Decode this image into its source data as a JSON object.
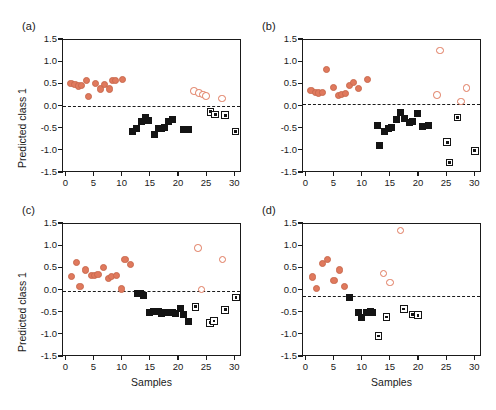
{
  "figure": {
    "panel_labels": [
      "(a)",
      "(b)",
      "(c)",
      "(d)"
    ],
    "accent_color": "#e0795d",
    "marker_dark_color": "#141414"
  },
  "axes": {
    "ylabel": "Predicted class 1",
    "xlabel": "Samples",
    "yticks": [
      "1.5",
      "1.0",
      "0.5",
      "0.0",
      "-0.5",
      "-1.0",
      "-1.5"
    ],
    "ytick_values": [
      1.5,
      1.0,
      0.5,
      0.0,
      -0.5,
      -1.0,
      -1.5
    ],
    "xticks": [
      "0",
      "5",
      "10",
      "15",
      "20",
      "25",
      "30"
    ],
    "xtick_values": [
      0,
      5,
      10,
      15,
      20,
      25,
      30
    ],
    "ylim": [
      -1.5,
      1.5
    ],
    "xlim": [
      -0.6,
      31.2
    ]
  },
  "chart_data": [
    {
      "type": "scatter",
      "panel": "(a)",
      "title": "",
      "xlabel": "Samples",
      "ylabel": "Predicted class 1",
      "xlim": [
        -0.6,
        31.2
      ],
      "ylim": [
        -1.5,
        1.5
      ],
      "grid": false,
      "legend": "none",
      "threshold_line": 0.0,
      "series": [
        {
          "name": "training class 1 (filled circle)",
          "marker": "filled-circle",
          "color": "#e0795d",
          "points": [
            [
              1.0,
              0.49
            ],
            [
              1.7,
              0.47
            ],
            [
              2.3,
              0.44
            ],
            [
              2.9,
              0.45
            ],
            [
              3.7,
              0.56
            ],
            [
              4.1,
              0.2
            ],
            [
              5.3,
              0.5
            ],
            [
              6.2,
              0.37
            ],
            [
              6.9,
              0.47
            ],
            [
              7.8,
              0.37
            ],
            [
              8.4,
              0.57
            ],
            [
              8.9,
              0.56
            ],
            [
              10.2,
              0.59
            ]
          ]
        },
        {
          "name": "training class 2 (filled square)",
          "marker": "filled-square",
          "color": "#141414",
          "points": [
            [
              11.9,
              -0.58
            ],
            [
              12.6,
              -0.52
            ],
            [
              13.6,
              -0.37
            ],
            [
              14.2,
              -0.28
            ],
            [
              14.7,
              -0.33
            ],
            [
              15.9,
              -0.65
            ],
            [
              16.6,
              -0.53
            ],
            [
              17.1,
              -0.52
            ],
            [
              17.6,
              -0.5
            ],
            [
              18.4,
              -0.37
            ],
            [
              19.1,
              -0.31
            ],
            [
              21.0,
              -0.55
            ],
            [
              21.8,
              -0.54
            ]
          ]
        },
        {
          "name": "test class 1 (open circle)",
          "marker": "open-circle",
          "color": "#e0795d",
          "points": [
            [
              22.9,
              0.33
            ],
            [
              23.7,
              0.28
            ],
            [
              24.4,
              0.25
            ],
            [
              25.0,
              0.22
            ],
            [
              27.8,
              0.16
            ]
          ]
        },
        {
          "name": "test class 2 (open square)",
          "marker": "open-square",
          "color": "#141414",
          "points": [
            [
              25.8,
              -0.14
            ],
            [
              26.6,
              -0.2
            ],
            [
              28.4,
              -0.22
            ],
            [
              30.2,
              -0.59
            ]
          ]
        }
      ]
    },
    {
      "type": "scatter",
      "panel": "(b)",
      "title": "",
      "xlabel": "Samples",
      "ylabel": "Predicted class 1",
      "xlim": [
        -0.6,
        31.2
      ],
      "ylim": [
        -1.5,
        1.5
      ],
      "grid": false,
      "legend": "none",
      "threshold_line": 0.03,
      "series": [
        {
          "name": "training class 1 (filled circle)",
          "marker": "filled-circle",
          "color": "#e0795d",
          "points": [
            [
              1.0,
              0.33
            ],
            [
              1.8,
              0.29
            ],
            [
              2.4,
              0.28
            ],
            [
              3.1,
              0.3
            ],
            [
              3.8,
              0.81
            ],
            [
              5.0,
              0.4
            ],
            [
              5.9,
              0.22
            ],
            [
              6.4,
              0.24
            ],
            [
              7.1,
              0.27
            ],
            [
              7.9,
              0.45
            ],
            [
              8.6,
              0.51
            ],
            [
              9.5,
              0.39
            ],
            [
              11.0,
              0.58
            ]
          ]
        },
        {
          "name": "training class 2 (filled square)",
          "marker": "filled-square",
          "color": "#141414",
          "points": [
            [
              12.9,
              -0.46
            ],
            [
              13.2,
              -0.91
            ],
            [
              14.1,
              -0.59
            ],
            [
              14.8,
              -0.53
            ],
            [
              15.3,
              -0.5
            ],
            [
              16.1,
              -0.31
            ],
            [
              16.9,
              -0.16
            ],
            [
              17.6,
              -0.3
            ],
            [
              18.5,
              -0.38
            ],
            [
              19.0,
              -0.35
            ],
            [
              20.0,
              -0.19
            ],
            [
              20.8,
              -0.48
            ],
            [
              21.8,
              -0.46
            ]
          ]
        },
        {
          "name": "test class 1 (open circle)",
          "marker": "open-circle",
          "color": "#e0795d",
          "points": [
            [
              23.9,
              1.24
            ],
            [
              23.4,
              0.24
            ],
            [
              27.6,
              0.09
            ],
            [
              28.6,
              0.39
            ]
          ]
        },
        {
          "name": "test class 2 (open square)",
          "marker": "open-square",
          "color": "#141414",
          "points": [
            [
              25.2,
              -0.83
            ],
            [
              25.6,
              -1.29
            ],
            [
              27.0,
              -0.27
            ],
            [
              30.1,
              -1.02
            ]
          ]
        }
      ]
    },
    {
      "type": "scatter",
      "panel": "(c)",
      "title": "",
      "xlabel": "Samples",
      "ylabel": "Predicted class 1",
      "xlim": [
        -0.6,
        31.2
      ],
      "ylim": [
        -1.5,
        1.5
      ],
      "grid": false,
      "legend": "none",
      "threshold_line": -0.04,
      "series": [
        {
          "name": "training class 1 (filled circle)",
          "marker": "filled-circle",
          "color": "#e0795d",
          "points": [
            [
              1.1,
              0.29
            ],
            [
              2.0,
              0.61
            ],
            [
              2.6,
              0.06
            ],
            [
              3.6,
              0.44
            ],
            [
              4.6,
              0.31
            ],
            [
              5.2,
              0.32
            ],
            [
              5.8,
              0.33
            ],
            [
              6.8,
              0.5
            ],
            [
              7.7,
              0.25
            ],
            [
              8.2,
              0.3
            ],
            [
              9.1,
              0.32
            ],
            [
              10.0,
              0.01
            ],
            [
              10.6,
              0.68
            ],
            [
              11.5,
              0.57
            ]
          ]
        },
        {
          "name": "training class 2 (filled square)",
          "marker": "filled-square",
          "color": "#141414",
          "points": [
            [
              12.8,
              -0.1
            ],
            [
              13.3,
              -0.1
            ],
            [
              13.9,
              -0.14
            ],
            [
              15.0,
              -0.51
            ],
            [
              15.6,
              -0.5
            ],
            [
              16.5,
              -0.49
            ],
            [
              17.0,
              -0.55
            ],
            [
              17.7,
              -0.52
            ],
            [
              18.4,
              -0.51
            ],
            [
              19.0,
              -0.52
            ],
            [
              19.6,
              -0.54
            ],
            [
              20.4,
              -0.42
            ],
            [
              21.0,
              -0.56
            ],
            [
              21.8,
              -0.73
            ]
          ]
        },
        {
          "name": "test class 1 (open circle)",
          "marker": "open-circle",
          "color": "#e0795d",
          "points": [
            [
              23.6,
              0.94
            ],
            [
              24.2,
              0.0
            ],
            [
              27.9,
              0.68
            ]
          ]
        },
        {
          "name": "test class 2 (open square)",
          "marker": "open-square",
          "color": "#141414",
          "points": [
            [
              23.1,
              -0.39
            ],
            [
              25.7,
              -0.75
            ],
            [
              26.4,
              -0.71
            ],
            [
              28.4,
              -0.46
            ],
            [
              30.3,
              -0.18
            ]
          ]
        }
      ]
    },
    {
      "type": "scatter",
      "panel": "(d)",
      "title": "",
      "xlabel": "Samples",
      "ylabel": "Predicted class 1",
      "xlim": [
        -0.6,
        31.2
      ],
      "ylim": [
        -1.5,
        1.5
      ],
      "grid": false,
      "legend": "none",
      "threshold_line": -0.14,
      "series": [
        {
          "name": "training class 1 (filled circle)",
          "marker": "filled-circle",
          "color": "#e0795d",
          "points": [
            [
              1.2,
              0.28
            ],
            [
              2.0,
              0.03
            ],
            [
              3.1,
              0.59
            ],
            [
              3.9,
              0.68
            ],
            [
              5.1,
              0.2
            ],
            [
              6.1,
              0.44
            ],
            [
              6.9,
              0.06
            ]
          ]
        },
        {
          "name": "training class 2 (filled square)",
          "marker": "filled-square",
          "color": "#141414",
          "points": [
            [
              7.9,
              -0.19
            ],
            [
              9.4,
              -0.51
            ],
            [
              10.0,
              -0.63
            ],
            [
              10.9,
              -0.52
            ],
            [
              11.5,
              -0.5
            ],
            [
              11.9,
              -0.52
            ]
          ]
        },
        {
          "name": "test class 1 (open circle)",
          "marker": "open-circle",
          "color": "#e0795d",
          "points": [
            [
              16.9,
              1.33
            ],
            [
              13.9,
              0.36
            ],
            [
              15.0,
              0.16
            ]
          ]
        },
        {
          "name": "test class 2 (open square)",
          "marker": "open-square",
          "color": "#141414",
          "points": [
            [
              13.0,
              -1.05
            ],
            [
              14.4,
              -0.62
            ],
            [
              17.5,
              -0.44
            ],
            [
              19.0,
              -0.56
            ],
            [
              20.0,
              -0.58
            ]
          ]
        }
      ]
    }
  ]
}
